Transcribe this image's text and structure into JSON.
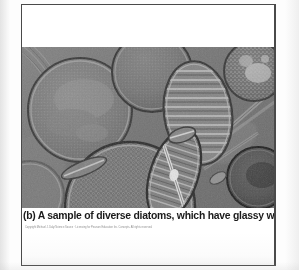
{
  "document": {
    "type": "scanned-textbook-page",
    "page_background": "#ffffff",
    "border_color": "#4a4a4a"
  },
  "figure": {
    "label": "(b)",
    "caption": "(b) A sample of diverse diatoms, which have glassy walls",
    "credit": "Copyright Michael J. Daly/Science Source  ·  Licensing for Pearson Education Inc. Concepts. All rights reserved.",
    "photo": {
      "alt_name": "diatom-micrograph",
      "tone": "monochrome-grey",
      "base_color": "#7d7d7d",
      "subjects": [
        {
          "name": "large-centric-diatom-upper-left",
          "shape": "circle"
        },
        {
          "name": "centric-diatom-top-center",
          "shape": "circle"
        },
        {
          "name": "triangular-diatom",
          "shape": "triangle"
        },
        {
          "name": "striated-lens-diatom",
          "shape": "lens"
        },
        {
          "name": "speckled-centric-diatom-upper-right",
          "shape": "circle"
        },
        {
          "name": "honeycomb-centric-diatom-bottom",
          "shape": "circle"
        },
        {
          "name": "navicula-diatom-bottom-center",
          "shape": "ellipse"
        },
        {
          "name": "dark-centric-diatom-right",
          "shape": "circle"
        },
        {
          "name": "needle-diatoms",
          "shape": "elongate-rods"
        }
      ]
    }
  }
}
